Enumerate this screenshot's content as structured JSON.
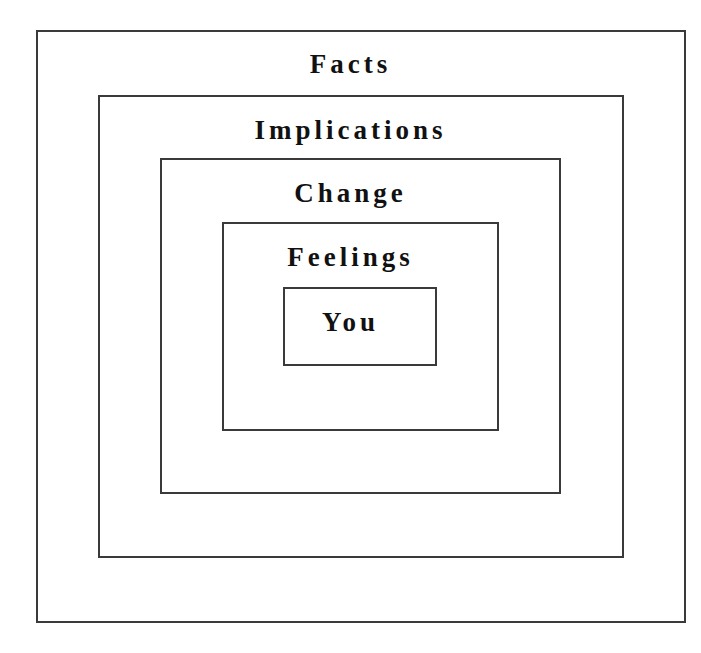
{
  "diagram": {
    "type": "nested-boxes",
    "layers": [
      {
        "label": "Facts"
      },
      {
        "label": "Implications"
      },
      {
        "label": "Change"
      },
      {
        "label": "Feelings"
      },
      {
        "label": "You"
      }
    ],
    "border_color": "#3a3a3a",
    "text_color": "#111111"
  }
}
